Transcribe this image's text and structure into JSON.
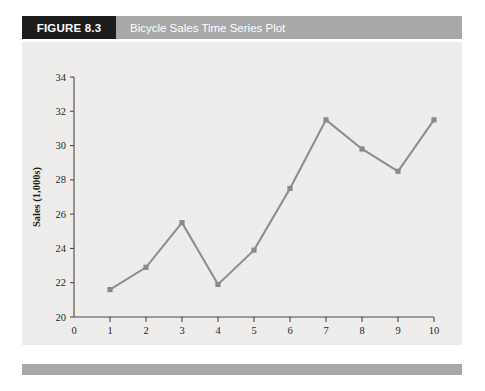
{
  "figure": {
    "badge_label": "FIGURE 8.3",
    "title": "Bicycle Sales Time Series Plot"
  },
  "colors": {
    "badge_background": "#1c1c1c",
    "title_bar": "#a8a8a8",
    "panel_background": "#efeeec",
    "series": "#8a8a8a",
    "axis": "#4a4a4a",
    "footer_bar": "#a8a8a8"
  },
  "chart_data": {
    "type": "line",
    "title": "Bicycle Sales Time Series Plot",
    "xlabel": "Year",
    "ylabel": "Sales (1,000s)",
    "x": [
      1,
      2,
      3,
      4,
      5,
      6,
      7,
      8,
      9,
      10
    ],
    "values": [
      21.6,
      22.9,
      25.5,
      21.9,
      23.9,
      27.5,
      31.5,
      29.8,
      28.5,
      31.5
    ],
    "series": [
      {
        "name": "Bicycle Sales",
        "values": [
          21.6,
          22.9,
          25.5,
          21.9,
          23.9,
          27.5,
          31.5,
          29.8,
          28.5,
          31.5
        ]
      }
    ],
    "xlim": [
      0,
      10
    ],
    "ylim": [
      20,
      34
    ],
    "xticks": [
      0,
      1,
      2,
      3,
      4,
      5,
      6,
      7,
      8,
      9,
      10
    ],
    "yticks": [
      20,
      22,
      24,
      26,
      28,
      30,
      32,
      34
    ],
    "xtick_labels": [
      "0",
      "1",
      "2",
      "3",
      "4",
      "5",
      "6",
      "7",
      "8",
      "9",
      "10"
    ],
    "ytick_labels": [
      "20",
      "22",
      "24",
      "26",
      "28",
      "30",
      "32",
      "34"
    ],
    "grid": false,
    "legend": "none",
    "marker": "square"
  }
}
